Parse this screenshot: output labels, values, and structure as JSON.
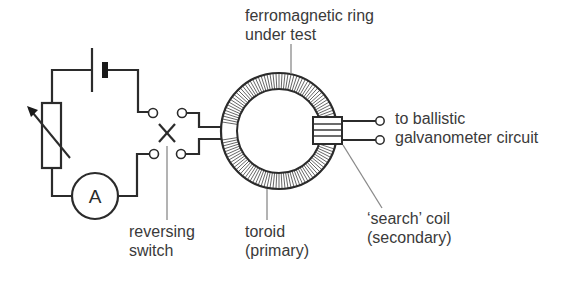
{
  "diagram": {
    "colors": {
      "line": "#2b2b2b",
      "leader": "#8a8a8a",
      "text": "#3a3a3a",
      "background": "#ffffff"
    },
    "ammeter_symbol": "A",
    "labels": {
      "ring": {
        "line1": "ferromagnetic ring",
        "line2": "under test"
      },
      "galvanometer": {
        "line1": "to ballistic",
        "line2": "galvanometer circuit"
      },
      "switch": {
        "line1": "reversing",
        "line2": "switch"
      },
      "toroid": {
        "line1": "toroid",
        "line2": "(primary)"
      },
      "search_coil": {
        "line1": "‘search’ coil",
        "line2": "(secondary)"
      }
    },
    "components": [
      {
        "name": "battery",
        "icon": "battery-icon"
      },
      {
        "name": "variable-resistor",
        "icon": "rheostat-icon"
      },
      {
        "name": "ammeter",
        "icon": "ammeter-icon"
      },
      {
        "name": "reversing-switch",
        "icon": "switch-icon"
      },
      {
        "name": "toroid-ring",
        "icon": "toroid-icon"
      },
      {
        "name": "search-coil",
        "icon": "coil-icon"
      }
    ]
  }
}
